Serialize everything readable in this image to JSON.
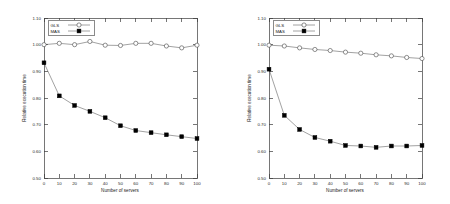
{
  "figure": {
    "panel_count": 2
  },
  "chart_data": [
    {
      "type": "line",
      "title": "",
      "xlabel": "Number of servers",
      "ylabel": "Relative execution time",
      "xlim": [
        0,
        100
      ],
      "ylim": [
        0.5,
        1.1
      ],
      "xticks": [
        0,
        10,
        20,
        30,
        40,
        50,
        60,
        70,
        80,
        90,
        100
      ],
      "xtick_labels": [
        "0",
        "10",
        "20",
        "30",
        "40",
        "50",
        "60",
        "70",
        "80",
        "90",
        "100"
      ],
      "yticks": [
        0.5,
        0.6,
        0.7,
        0.8,
        0.9,
        1.0,
        1.1
      ],
      "ytick_labels": [
        "0.50",
        "0.60",
        "0.70",
        "0.80",
        "0.90",
        "1.00",
        "1.10"
      ],
      "grid": false,
      "legend_position": "top-left",
      "x": [
        0,
        10,
        20,
        30,
        40,
        50,
        60,
        70,
        80,
        90,
        100
      ],
      "series": [
        {
          "name": "GLS",
          "marker": "open-circle",
          "values": [
            1.0,
            1.005,
            1.0,
            1.012,
            0.998,
            0.997,
            1.005,
            1.005,
            0.995,
            0.988,
            0.998
          ]
        },
        {
          "name": "MAS",
          "marker": "filled-square",
          "values": [
            0.932,
            0.808,
            0.772,
            0.75,
            0.726,
            0.696,
            0.678,
            0.67,
            0.662,
            0.655,
            0.648
          ]
        }
      ]
    },
    {
      "type": "line",
      "title": "",
      "xlabel": "Number of servers",
      "ylabel": "Relative execution time",
      "xlim": [
        0,
        100
      ],
      "ylim": [
        0.5,
        1.1
      ],
      "xticks": [
        0,
        10,
        20,
        30,
        40,
        50,
        60,
        70,
        80,
        90,
        100
      ],
      "xtick_labels": [
        "0",
        "10",
        "20",
        "30",
        "40",
        "50",
        "60",
        "70",
        "80",
        "90",
        "100"
      ],
      "yticks": [
        0.5,
        0.6,
        0.7,
        0.8,
        0.9,
        1.0,
        1.1
      ],
      "ytick_labels": [
        "0.50",
        "0.60",
        "0.70",
        "0.80",
        "0.90",
        "1.00",
        "1.10"
      ],
      "grid": false,
      "legend_position": "top-left",
      "x": [
        0,
        10,
        20,
        30,
        40,
        50,
        60,
        70,
        80,
        90,
        100
      ],
      "series": [
        {
          "name": "GLS",
          "marker": "open-circle",
          "values": [
            0.998,
            0.995,
            0.988,
            0.982,
            0.978,
            0.972,
            0.968,
            0.962,
            0.958,
            0.952,
            0.948
          ]
        },
        {
          "name": "MAS",
          "marker": "filled-square",
          "values": [
            0.908,
            0.735,
            0.682,
            0.652,
            0.638,
            0.622,
            0.62,
            0.615,
            0.62,
            0.62,
            0.622
          ]
        }
      ]
    }
  ],
  "colors": {
    "line": "#555555",
    "axis": "#3c3c3c",
    "text": "#1a1a1a",
    "marker_fill": "#000000",
    "background": "#ffffff"
  }
}
